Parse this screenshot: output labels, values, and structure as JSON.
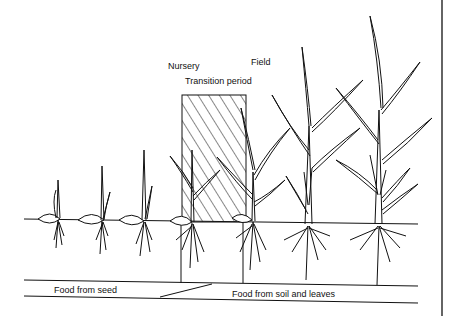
{
  "labels": {
    "nursery": "Nursery",
    "field": "Field",
    "transition": "Transition period",
    "food_seed": "Food from seed",
    "food_soil": "Food from soil and leaves"
  },
  "colors": {
    "ink": "#111111",
    "background": "#ffffff"
  },
  "stages": [
    {
      "id": 1,
      "zone": "nursery",
      "x": 50
    },
    {
      "id": 2,
      "zone": "nursery",
      "x": 103
    },
    {
      "id": 3,
      "zone": "nursery",
      "x": 143
    },
    {
      "id": 4,
      "zone": "nursery",
      "x": 192
    },
    {
      "id": 5,
      "zone": "transition",
      "x": 252
    },
    {
      "id": 6,
      "zone": "field",
      "x": 308
    },
    {
      "id": 7,
      "zone": "field",
      "x": 378
    }
  ]
}
